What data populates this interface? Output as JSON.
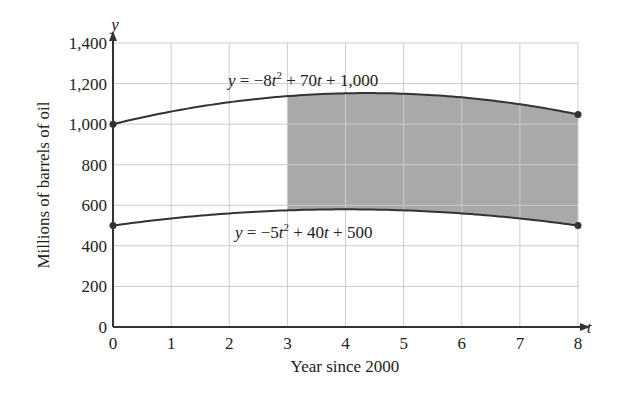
{
  "chart_data": {
    "type": "line",
    "title": "",
    "xlabel": "Year since 2000",
    "ylabel": "Millions of barrels of oil",
    "x_axis_var": "t",
    "y_axis_var": "y",
    "xlim": [
      0,
      8
    ],
    "ylim": [
      0,
      1400
    ],
    "x_ticks": [
      "0",
      "1",
      "2",
      "3",
      "4",
      "5",
      "6",
      "7",
      "8"
    ],
    "y_ticks": [
      "0",
      "200",
      "400",
      "600",
      "800",
      "1,000",
      "1,200",
      "1,400"
    ],
    "grid": true,
    "series": [
      {
        "name": "upper",
        "equation_label": "y = −8t² + 70t + 1,000",
        "coefficients": {
          "a": -8,
          "b": 70,
          "c": 1000
        },
        "x": [
          0,
          1,
          2,
          3,
          4,
          5,
          6,
          7,
          8
        ],
        "values": [
          1000,
          1062,
          1108,
          1138,
          1152,
          1150,
          1132,
          1098,
          1048
        ],
        "endpoints_marked": true
      },
      {
        "name": "lower",
        "equation_label": "y = −5t² + 40t + 500",
        "coefficients": {
          "a": -5,
          "b": 40,
          "c": 500
        },
        "x": [
          0,
          1,
          2,
          3,
          4,
          5,
          6,
          7,
          8
        ],
        "values": [
          500,
          535,
          560,
          575,
          580,
          575,
          560,
          535,
          500
        ],
        "endpoints_marked": true
      }
    ],
    "shaded_region": {
      "between": [
        "upper",
        "lower"
      ],
      "t_from": 3,
      "t_to": 8,
      "color": "#a9a9a9"
    },
    "colors": {
      "line": "#333333",
      "grid": "#cccccc",
      "shade": "#a9a9a9",
      "axis": "#333333"
    }
  }
}
